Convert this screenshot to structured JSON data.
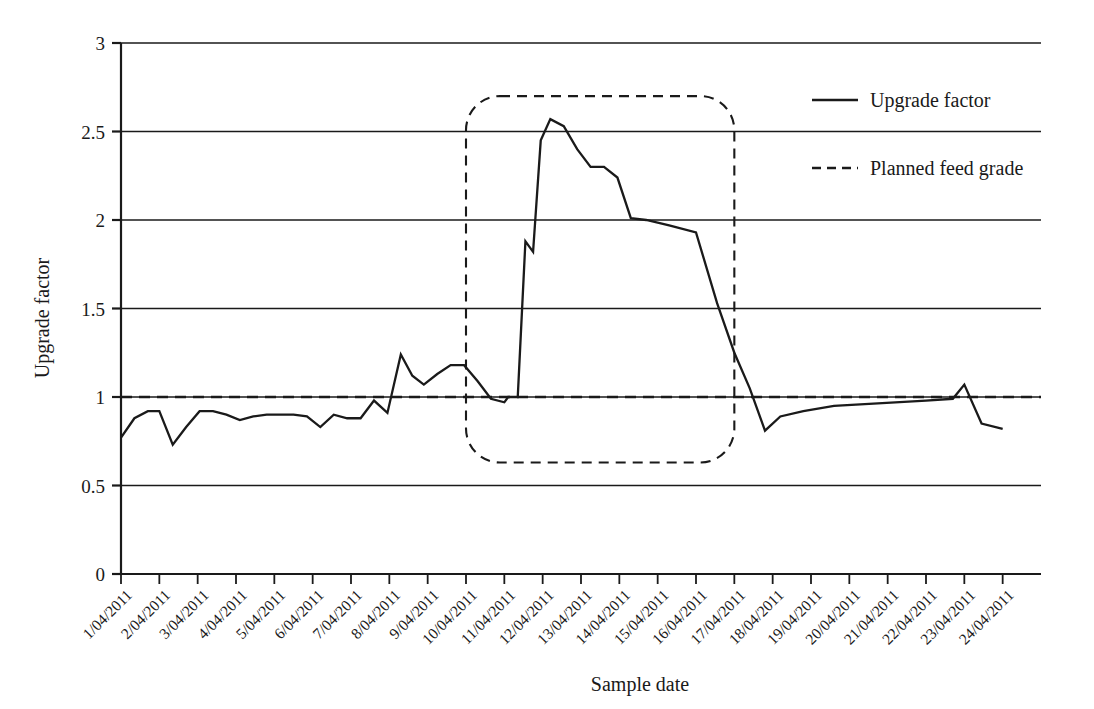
{
  "chart_data": {
    "type": "line",
    "title": "",
    "xlabel": "Sample date",
    "ylabel": "Upgrade factor",
    "ylim": [
      0,
      3
    ],
    "yticks": [
      0,
      0.5,
      1,
      1.5,
      2,
      2.5,
      3
    ],
    "ytick_labels": [
      "0",
      "0.5",
      "1",
      "1.5",
      "2",
      "2.5",
      "3"
    ],
    "grid": "horizontal",
    "legend_position": "top-right",
    "categories": [
      "1/04/2011",
      "2/04/2011",
      "3/04/2011",
      "4/04/2011",
      "5/04/2011",
      "6/04/2011",
      "7/04/2011",
      "8/04/2011",
      "9/04/2011",
      "10/04/2011",
      "11/04/2011",
      "12/04/2011",
      "13/04/2011",
      "14/04/2011",
      "15/04/2011",
      "16/04/2011",
      "17/04/2011",
      "18/04/2011",
      "19/04/2011",
      "20/04/2011",
      "21/04/2011",
      "22/04/2011",
      "23/04/2011",
      "24/04/2011"
    ],
    "series": [
      {
        "name": "Upgrade factor",
        "style": "solid",
        "x": [
          1.0,
          1.35,
          1.7,
          2.0,
          2.35,
          2.7,
          3.05,
          3.4,
          3.75,
          4.1,
          4.45,
          4.8,
          5.15,
          5.5,
          5.85,
          6.2,
          6.55,
          6.9,
          7.25,
          7.6,
          7.95,
          8.3,
          8.6,
          8.9,
          9.25,
          9.6,
          9.95,
          10.3,
          10.65,
          11.0,
          11.1,
          11.35,
          11.55,
          11.75,
          11.95,
          12.2,
          12.55,
          12.9,
          13.25,
          13.6,
          13.95,
          14.3,
          14.7,
          15.3,
          16.0,
          16.55,
          17.0,
          17.4,
          17.8,
          18.2,
          18.8,
          19.6,
          20.4,
          21.2,
          22.0,
          22.7,
          23.0,
          23.45,
          24.0
        ],
        "y": [
          0.77,
          0.88,
          0.92,
          0.92,
          0.73,
          0.83,
          0.92,
          0.92,
          0.9,
          0.87,
          0.89,
          0.9,
          0.9,
          0.9,
          0.89,
          0.83,
          0.9,
          0.88,
          0.88,
          0.98,
          0.91,
          1.24,
          1.12,
          1.07,
          1.13,
          1.18,
          1.18,
          1.09,
          0.99,
          0.97,
          1.0,
          1.0,
          1.88,
          1.82,
          2.45,
          2.57,
          2.53,
          2.4,
          2.3,
          2.3,
          2.24,
          2.01,
          2.0,
          1.97,
          1.93,
          1.53,
          1.25,
          1.05,
          0.81,
          0.89,
          0.92,
          0.95,
          0.96,
          0.97,
          0.98,
          0.99,
          1.07,
          0.85,
          0.82
        ]
      },
      {
        "name": "Planned feed grade",
        "style": "dashed",
        "constant_value": 1.0
      }
    ],
    "annotations": [
      {
        "type": "highlight-box",
        "shape": "rounded-rectangle",
        "style": "dashed",
        "x_start": "10/04/2011",
        "x_end": "17/04/2011",
        "y_top": 2.7,
        "y_bottom": 0.63
      }
    ]
  },
  "axes": {
    "y_title": "Upgrade factor",
    "x_title": "Sample date",
    "y_tick_labels": [
      "3",
      "2.5",
      "2",
      "1.5",
      "1",
      "0.5",
      "0"
    ],
    "x_tick_labels": [
      "1/04/2011",
      "2/04/2011",
      "3/04/2011",
      "4/04/2011",
      "5/04/2011",
      "6/04/2011",
      "7/04/2011",
      "8/04/2011",
      "9/04/2011",
      "10/04/2011",
      "11/04/2011",
      "12/04/2011",
      "13/04/2011",
      "14/04/2011",
      "15/04/2011",
      "16/04/2011",
      "17/04/2011",
      "18/04/2011",
      "19/04/2011",
      "20/04/2011",
      "21/04/2011",
      "22/04/2011",
      "23/04/2011",
      "24/04/2011"
    ]
  },
  "legend": {
    "entries": [
      {
        "label": "Upgrade factor",
        "style": "solid"
      },
      {
        "label": "Planned feed grade",
        "style": "dashed"
      }
    ]
  },
  "colors": {
    "line": "#1a1a1a",
    "grid": "#1a1a1a",
    "background": "#ffffff"
  }
}
